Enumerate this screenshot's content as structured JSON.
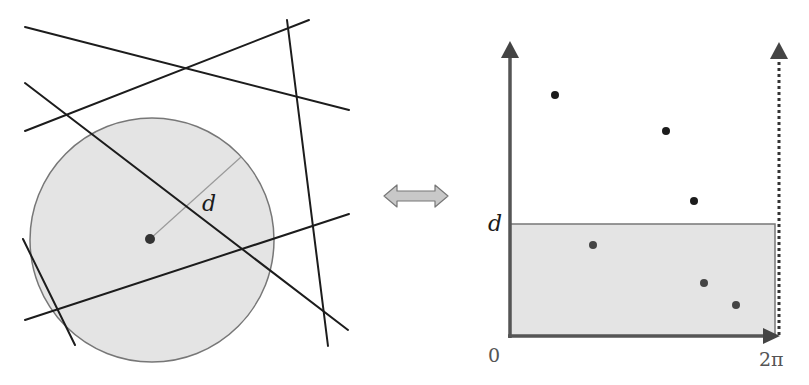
{
  "left_panel": {
    "title": "Lines around a point in the plane",
    "circle": {
      "cx": 152,
      "cy": 240,
      "r": 122,
      "fill": "#e4e4e4",
      "stroke": "#777777"
    },
    "center_point": {
      "x": 150,
      "y": 239
    },
    "radius_line": {
      "x1": 150,
      "y1": 239,
      "x2": 241,
      "y2": 157
    },
    "radius_label": "d",
    "lines": [
      {
        "x1": 25,
        "y1": 27,
        "x2": 349,
        "y2": 110
      },
      {
        "x1": 25,
        "y1": 131,
        "x2": 309,
        "y2": 20
      },
      {
        "x1": 25,
        "y1": 83,
        "x2": 348,
        "y2": 330
      },
      {
        "x1": 287,
        "y1": 20,
        "x2": 328,
        "y2": 346
      },
      {
        "x1": 25,
        "y1": 320,
        "x2": 349,
        "y2": 214
      },
      {
        "x1": 23,
        "y1": 239,
        "x2": 75,
        "y2": 345
      }
    ]
  },
  "equivalence_arrow": {
    "icon": "double-headed-arrow-icon",
    "fill": "#c8c8c8",
    "stroke": "#777777"
  },
  "right_panel": {
    "y_axis_label": "d",
    "x_min_label": "0",
    "x_max_label": "2π",
    "shaded_region": {
      "fill": "#e4e4e4"
    },
    "points_outside": [
      {
        "x": 555,
        "y": 95
      },
      {
        "x": 666,
        "y": 131
      },
      {
        "x": 694,
        "y": 201
      }
    ],
    "points_inside": [
      {
        "x": 593,
        "y": 245
      },
      {
        "x": 704,
        "y": 283
      },
      {
        "x": 736,
        "y": 305
      }
    ]
  }
}
